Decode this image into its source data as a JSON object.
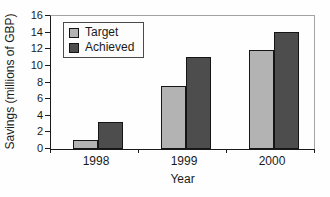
{
  "chart_data": {
    "type": "bar",
    "title": "",
    "xlabel": "Year",
    "ylabel": "Savings (millions of GBP)",
    "categories": [
      "1998",
      "1999",
      "2000"
    ],
    "series": [
      {
        "name": "Target",
        "color": "#b3b3b3",
        "values": [
          1.0,
          7.4,
          11.8
        ]
      },
      {
        "name": "Achieved",
        "color": "#4d4d4d",
        "values": [
          3.1,
          10.9,
          13.9
        ]
      }
    ],
    "ylim": [
      0,
      16
    ],
    "yticks": [
      0,
      2,
      4,
      6,
      8,
      10,
      12,
      14,
      16
    ],
    "grid": false,
    "legend_position": "top-left-inside",
    "axis_color": "#1a1a1a",
    "plot_border_color": "#a3a3a3",
    "background": "#fefefe"
  }
}
